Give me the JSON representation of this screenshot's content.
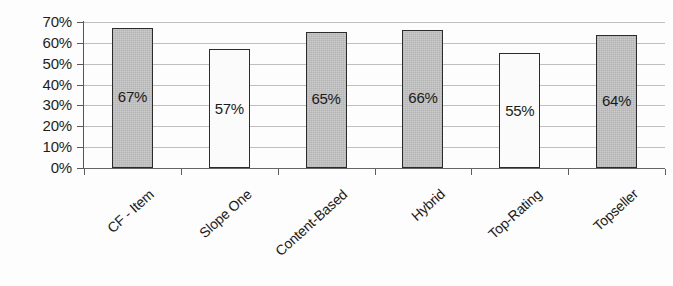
{
  "chart_data": {
    "type": "bar",
    "title": "",
    "subtitle": "",
    "xlabel": "",
    "ylabel": "",
    "categories": [
      "CF - Item",
      "Slope One",
      "Content-Based",
      "Hybrid",
      "Top-Rating",
      "Topseller"
    ],
    "values": [
      67,
      57,
      65,
      66,
      55,
      64
    ],
    "value_labels": [
      "67%",
      "57%",
      "65%",
      "66%",
      "55%",
      "64%"
    ],
    "series": [
      {
        "name": "",
        "values": [
          67,
          57,
          65,
          66,
          55,
          64
        ]
      }
    ],
    "bar_styles": [
      "filled",
      "hollow",
      "filled",
      "filled",
      "hollow",
      "filled"
    ],
    "ylim": [
      0,
      70
    ],
    "ytick_values": [
      70,
      60,
      50,
      40,
      30,
      20,
      10,
      0
    ],
    "ytick_labels": [
      "70%",
      "60%",
      "50%",
      "40%",
      "30%",
      "20%",
      "10%",
      "0%"
    ],
    "grid": true,
    "legend": "none",
    "colors": {
      "bar_fill": "#c6c6c6",
      "bar_hollow": "#fbfbfb",
      "bar_border": "#2c2c2c",
      "gridline": "#9a9a9a",
      "axis": "#555555",
      "text": "#1a1a1a",
      "background": "#fdfdfd"
    }
  }
}
